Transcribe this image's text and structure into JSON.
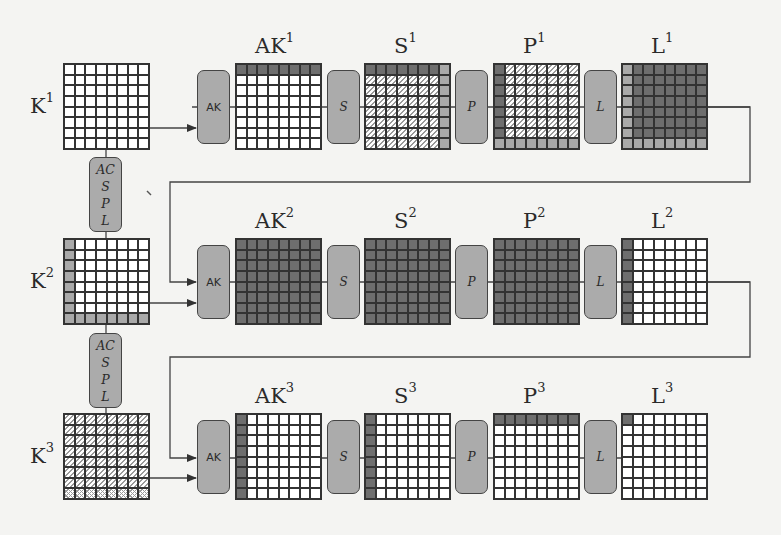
{
  "diagram": {
    "colors": {
      "background": "#f4f4f2",
      "dark_cell": "#6e6e6e",
      "light_gray_cell": "#a9a9a9",
      "white_cell": "#ffffff",
      "op_box": "#ababab",
      "line": "#333333"
    },
    "legend_codes": {
      "w": "white (inactive)",
      "d": "dark gray (active)",
      "g": "light gray",
      "h": "hatched",
      "x": "cross-hatched"
    },
    "key_schedule_box": {
      "lines": [
        "AC",
        "S",
        "P",
        "L"
      ]
    },
    "rounds": [
      {
        "key": {
          "label": "K",
          "sup": "1",
          "cells": [
            "wwwwwwww",
            "wwwwwwww",
            "wwwwwwww",
            "wwwwwwww",
            "wwwwwwww",
            "wwwwwwww",
            "wwwwwwww",
            "wwwwwwww"
          ]
        },
        "ops": [
          {
            "label": "AK"
          },
          {
            "label": "S"
          },
          {
            "label": "P"
          },
          {
            "label": "L"
          }
        ],
        "states": [
          {
            "label": "AK",
            "sup": "1",
            "cells": [
              "dddddddd",
              "wwwwwwww",
              "wwwwwwww",
              "wwwwwwww",
              "wwwwwwww",
              "wwwwwwww",
              "wwwwwwww",
              "wwwwwwww"
            ]
          },
          {
            "label": "S",
            "sup": "1",
            "cells": [
              "dddddddg",
              "hhhhhhhg",
              "hhhhhhhg",
              "hhhhhhhg",
              "hhhhhhhg",
              "hhhhhhhg",
              "hhhhhhhg",
              "hhhhhhhg"
            ]
          },
          {
            "label": "P",
            "sup": "1",
            "cells": [
              "dhhhhhhh",
              "dhhhhhhh",
              "dhhhhhhh",
              "dhhhhhhh",
              "dhhhhhhh",
              "dhhhhhhh",
              "dhhhhhhh",
              "gggggggg"
            ]
          },
          {
            "label": "L",
            "sup": "1",
            "cells": [
              "gddddddd",
              "gddddddd",
              "gddddddd",
              "gddddddd",
              "gddddddd",
              "gddddddd",
              "gddddddd",
              "gggggggg"
            ]
          }
        ]
      },
      {
        "key": {
          "label": "K",
          "sup": "2",
          "cells": [
            "gwwwwwww",
            "gwwwwwww",
            "gwwwwwww",
            "gwwwwwww",
            "gwwwwwww",
            "gwwwwwww",
            "gwwwwwww",
            "gggggggg"
          ]
        },
        "ops": [
          {
            "label": "AK"
          },
          {
            "label": "S"
          },
          {
            "label": "P"
          },
          {
            "label": "L"
          }
        ],
        "states": [
          {
            "label": "AK",
            "sup": "2",
            "cells": [
              "dddddddd",
              "dddddddd",
              "dddddddd",
              "dddddddd",
              "dddddddd",
              "dddddddd",
              "dddddddd",
              "dddddddd"
            ]
          },
          {
            "label": "S",
            "sup": "2",
            "cells": [
              "dddddddd",
              "dddddddd",
              "dddddddd",
              "dddddddd",
              "dddddddd",
              "dddddddd",
              "dddddddd",
              "dddddddd"
            ]
          },
          {
            "label": "P",
            "sup": "2",
            "cells": [
              "dddddddd",
              "dddddddd",
              "dddddddd",
              "dddddddd",
              "dddddddd",
              "dddddddd",
              "dddddddd",
              "dddddddd"
            ]
          },
          {
            "label": "L",
            "sup": "2",
            "cells": [
              "dwwwwwww",
              "dwwwwwww",
              "dwwwwwww",
              "dwwwwwww",
              "dwwwwwww",
              "dwwwwwww",
              "dwwwwwww",
              "dwwwwwww"
            ]
          }
        ]
      },
      {
        "key": {
          "label": "K",
          "sup": "3",
          "cells": [
            "hhhhhhhh",
            "hhhhhhhh",
            "hhhhhhhh",
            "hhhhhhhh",
            "hhhhhhhh",
            "hhhhhhhh",
            "hhhhhhhh",
            "xxxxxxxx"
          ]
        },
        "ops": [
          {
            "label": "AK"
          },
          {
            "label": "S"
          },
          {
            "label": "P"
          },
          {
            "label": "L"
          }
        ],
        "states": [
          {
            "label": "AK",
            "sup": "3",
            "cells": [
              "dwwwwwww",
              "dwwwwwww",
              "dwwwwwww",
              "dwwwwwww",
              "dwwwwwww",
              "dwwwwwww",
              "dwwwwwww",
              "dwwwwwww"
            ]
          },
          {
            "label": "S",
            "sup": "3",
            "cells": [
              "dwwwwwww",
              "dwwwwwww",
              "dwwwwwww",
              "dwwwwwww",
              "dwwwwwww",
              "dwwwwwww",
              "dwwwwwww",
              "dwwwwwww"
            ]
          },
          {
            "label": "P",
            "sup": "3",
            "cells": [
              "dddddddd",
              "wwwwwwww",
              "wwwwwwww",
              "wwwwwwww",
              "wwwwwwww",
              "wwwwwwww",
              "wwwwwwww",
              "wwwwwwww"
            ]
          },
          {
            "label": "L",
            "sup": "3",
            "cells": [
              "dwwwwwww",
              "wwwwwwww",
              "wwwwwwww",
              "wwwwwwww",
              "wwwwwwww",
              "wwwwwwww",
              "wwwwwwww",
              "wwwwwwww"
            ]
          }
        ]
      }
    ]
  }
}
